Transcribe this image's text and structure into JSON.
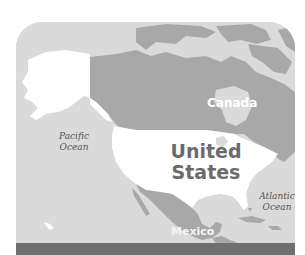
{
  "map": {
    "type": "political-region-map",
    "region": "North America",
    "colors": {
      "ocean": "#dadada",
      "land_other": "#a8a8a8",
      "land_highlight": "#ffffff",
      "bottom_bar": "#6f6f6f",
      "background": "#ffffff"
    },
    "countries": {
      "canada": "Canada",
      "united_states_line1": "United",
      "united_states_line2": "States",
      "mexico": "Mexico"
    },
    "oceans": {
      "pacific_line1": "Pacific",
      "pacific_line2": "Ocean",
      "atlantic_line1": "Atlantic",
      "atlantic_line2": "Ocean"
    },
    "highlighted": "United States"
  }
}
